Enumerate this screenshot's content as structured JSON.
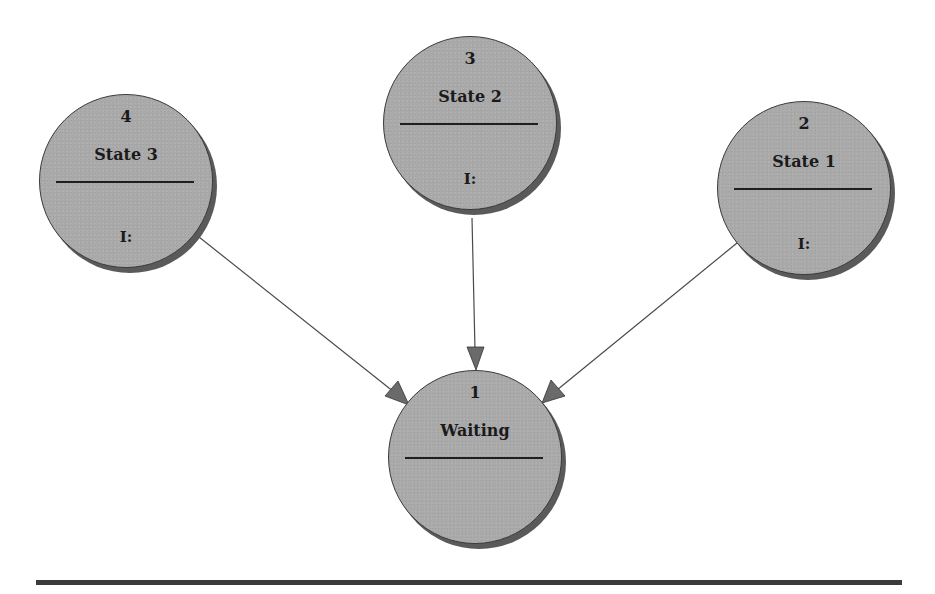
{
  "diagram": {
    "type": "state-transition-diagram",
    "colors": {
      "node_fill": "#a9a9a9",
      "node_border": "#3a3a3a",
      "node_shadow": "#5a5a5a",
      "edge": "#4a4a4a",
      "arrowhead": "#6a6a6a",
      "rule": "#3b3b3b"
    },
    "nodes": [
      {
        "id": "1",
        "number": "1",
        "name": "Waiting",
        "invariant": ""
      },
      {
        "id": "2",
        "number": "2",
        "name": "State 1",
        "invariant": "I:"
      },
      {
        "id": "3",
        "number": "3",
        "name": "State 2",
        "invariant": "I:"
      },
      {
        "id": "4",
        "number": "4",
        "name": "State 3",
        "invariant": "I:"
      }
    ],
    "edges": [
      {
        "from": "4",
        "to": "1"
      },
      {
        "from": "3",
        "to": "1"
      },
      {
        "from": "2",
        "to": "1"
      }
    ]
  }
}
